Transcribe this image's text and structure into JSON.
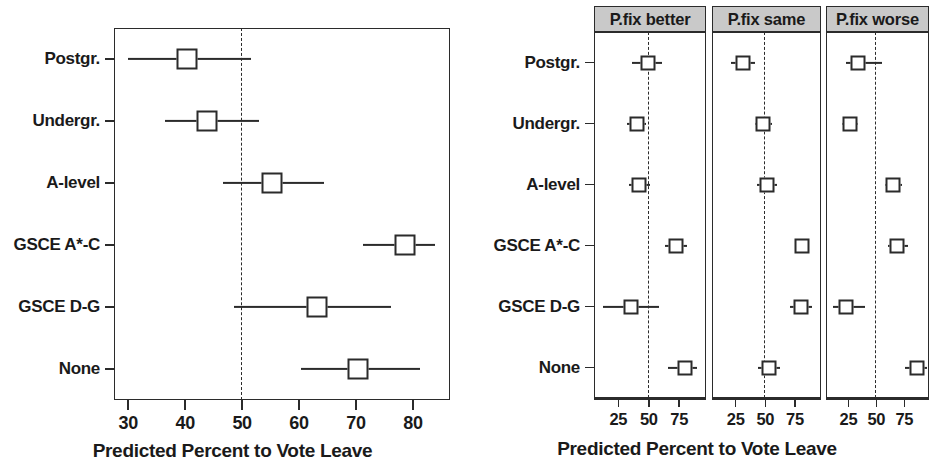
{
  "chart_data": {
    "type": "scatter",
    "title": "",
    "xlabel": "Predicted Percent to Vote Leave",
    "ylabel": "",
    "categories": [
      "Postgr.",
      "Undergr.",
      "A-level",
      "GSCE A*-C",
      "GSCE D-G",
      "None"
    ],
    "reference_line": 50,
    "grid": false,
    "legend": null,
    "panels": [
      {
        "name": "overall",
        "strip_label": "",
        "xlim": [
          27.5,
          86.5
        ],
        "xticks": [
          30,
          40,
          50,
          60,
          70,
          80
        ],
        "xticklabels": [
          "30",
          "40",
          "50",
          "60",
          "70",
          "80"
        ],
        "points": [
          {
            "category": "Postgr.",
            "estimate": 40.3,
            "low": 30.0,
            "high": 51.6
          },
          {
            "category": "Undergr.",
            "estimate": 43.9,
            "low": 36.4,
            "high": 53.0
          },
          {
            "category": "A-level",
            "estimate": 55.3,
            "low": 46.7,
            "high": 64.4
          },
          {
            "category": "GSCE A*-C",
            "estimate": 78.6,
            "low": 71.3,
            "high": 83.9
          },
          {
            "category": "GSCE D-G",
            "estimate": 63.2,
            "low": 48.6,
            "high": 76.1
          },
          {
            "category": "None",
            "estimate": 70.3,
            "low": 60.4,
            "high": 81.2
          }
        ]
      },
      {
        "name": "pfix-better",
        "strip_label": "P.fix better",
        "xlim": [
          5,
          97
        ],
        "xticks": [
          25,
          50,
          75
        ],
        "xticklabels": [
          "25",
          "50",
          "75"
        ],
        "points": [
          {
            "category": "Postgr.",
            "estimate": 49.0,
            "low": 36.0,
            "high": 61.0
          },
          {
            "category": "Undergr.",
            "estimate": 40.0,
            "low": 32.0,
            "high": 48.0
          },
          {
            "category": "A-level",
            "estimate": 42.0,
            "low": 34.0,
            "high": 51.0
          },
          {
            "category": "GSCE A*-C",
            "estimate": 72.0,
            "low": 63.0,
            "high": 81.0
          },
          {
            "category": "GSCE D-G",
            "estimate": 35.0,
            "low": 12.0,
            "high": 58.0
          },
          {
            "category": "None",
            "estimate": 80.0,
            "low": 66.0,
            "high": 90.0
          }
        ]
      },
      {
        "name": "pfix-same",
        "strip_label": "P.fix same",
        "xlim": [
          5,
          97
        ],
        "xticks": [
          25,
          50,
          75
        ],
        "xticklabels": [
          "25",
          "50",
          "75"
        ],
        "points": [
          {
            "category": "Postgr.",
            "estimate": 31.0,
            "low": 21.0,
            "high": 41.0
          },
          {
            "category": "Undergr.",
            "estimate": 48.0,
            "low": 41.0,
            "high": 56.0
          },
          {
            "category": "A-level",
            "estimate": 51.0,
            "low": 43.0,
            "high": 60.0
          },
          {
            "category": "GSCE A*-C",
            "estimate": 81.0,
            "low": 75.0,
            "high": 87.0
          },
          {
            "category": "GSCE D-G",
            "estimate": 80.0,
            "low": 71.0,
            "high": 89.0
          },
          {
            "category": "None",
            "estimate": 53.0,
            "low": 44.0,
            "high": 62.0
          }
        ]
      },
      {
        "name": "pfix-worse",
        "strip_label": "P.fix worse",
        "xlim": [
          5,
          97
        ],
        "xticks": [
          25,
          50,
          75
        ],
        "xticklabels": [
          "25",
          "50",
          "75"
        ],
        "points": [
          {
            "category": "Postgr.",
            "estimate": 34.0,
            "low": 23.0,
            "high": 55.0
          },
          {
            "category": "Undergr.",
            "estimate": 26.0,
            "low": 19.0,
            "high": 34.0
          },
          {
            "category": "A-level",
            "estimate": 65.0,
            "low": 58.0,
            "high": 73.0
          },
          {
            "category": "GSCE A*-C",
            "estimate": 68.0,
            "low": 60.0,
            "high": 78.0
          },
          {
            "category": "GSCE D-G",
            "estimate": 23.0,
            "low": 11.0,
            "high": 40.0
          },
          {
            "category": "None",
            "estimate": 86.0,
            "low": 76.0,
            "high": 95.0
          }
        ]
      }
    ]
  },
  "left_chart": {
    "xlabel": "Predicted Percent to Vote Leave"
  },
  "right_chart": {
    "xlabel": "Predicted Percent to Vote Leave",
    "strips": [
      "P.fix better",
      "P.fix same",
      "P.fix worse"
    ]
  },
  "colors": {
    "ink": "#2b2b2b",
    "strip_fill": "#c9c9c9",
    "marker_fill": "#ffffff",
    "background": "#ffffff"
  }
}
